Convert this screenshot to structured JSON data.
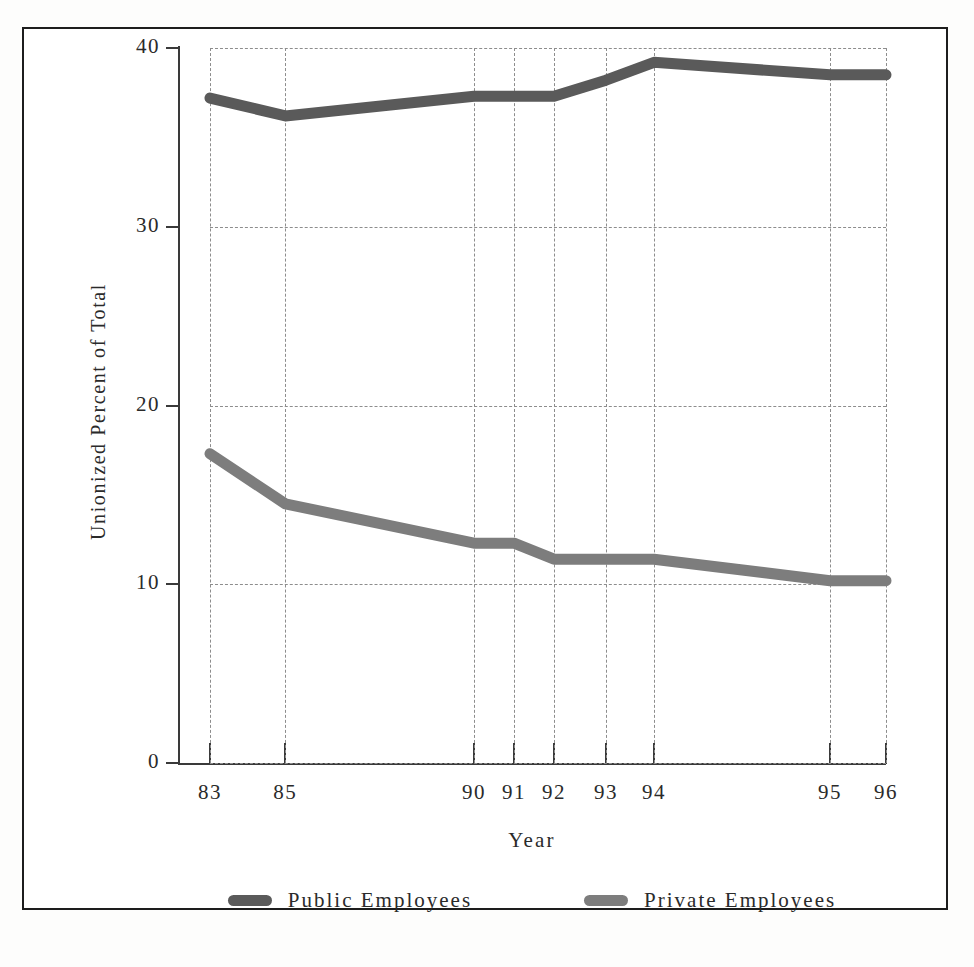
{
  "figure": {
    "title": "",
    "background_color": "#ffffff",
    "frame_color": "#1d1d1d"
  },
  "axes": {
    "y_title": "Unionized Percent of Total",
    "x_title": "Year",
    "y_ticks": [
      "0",
      "10",
      "20",
      "30",
      "40"
    ],
    "x_ticks": [
      "83",
      "85",
      "90",
      "91",
      "92",
      "93",
      "94",
      "95",
      "96"
    ]
  },
  "legend": {
    "items": [
      {
        "label": "Public Employees",
        "color": "#5a5a5a",
        "swatch": "line-swatch"
      },
      {
        "label": "Private Employees",
        "color": "#7d7d7d",
        "swatch": "line-swatch"
      }
    ]
  },
  "chart_data": {
    "type": "line",
    "title": "",
    "xlabel": "Year",
    "ylabel": "Unionized Percent of Total",
    "x": [
      83,
      85,
      90,
      91,
      92,
      93,
      94,
      95,
      96
    ],
    "xtick_labels": [
      "83",
      "85",
      "90",
      "91",
      "92",
      "93",
      "94",
      "95",
      "96"
    ],
    "ylim": [
      0,
      40
    ],
    "ytick_values": [
      0,
      10,
      20,
      30,
      40
    ],
    "grid": true,
    "grid_style": "dashed",
    "legend_position": "bottom-center",
    "series": [
      {
        "name": "Public Employees",
        "color": "#5a5a5a",
        "values": [
          37.2,
          36.2,
          37.3,
          37.3,
          37.3,
          38.2,
          39.2,
          38.5,
          38.5
        ]
      },
      {
        "name": "Private Employees",
        "color": "#7d7d7d",
        "values": [
          17.3,
          14.5,
          12.3,
          12.3,
          11.4,
          11.4,
          11.4,
          10.2,
          10.2
        ]
      }
    ]
  }
}
